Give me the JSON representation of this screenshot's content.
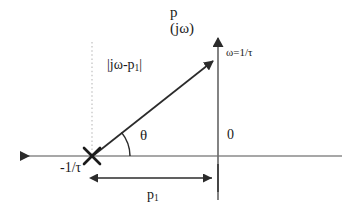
{
  "figure": {
    "type": "complex-plane-pole-diagram",
    "background_color": "#ffffff",
    "ink_color": "#1a1a1a",
    "axis_color": "#7a7a7a",
    "guide_color": "#c9c9c9"
  },
  "labels": {
    "vertical_axis_line1": "p",
    "vertical_axis_line2": "(jω)",
    "frequency_point": "ω=1/τ",
    "vector_magnitude_prefix": "|jω-p",
    "vector_magnitude_sub": "1",
    "vector_magnitude_suffix": "|",
    "angle": "θ",
    "origin": "0",
    "pole_position": "-1/τ",
    "distance_prefix": "p",
    "distance_sub": "1"
  },
  "geometry": {
    "origin_x": 218,
    "origin_y": 156,
    "pole_x": 92,
    "pole_y": 156,
    "frequency_point_x": 218,
    "frequency_point_y": 57,
    "real_axis_left_arrow_x": 12,
    "real_axis_right_end_x": 342,
    "imag_axis_top_arrow_y": 30,
    "imag_axis_bottom_y": 200,
    "dim_line_y": 178,
    "angle_arc_radius": 38,
    "dotted_guide_top_y": 42
  }
}
